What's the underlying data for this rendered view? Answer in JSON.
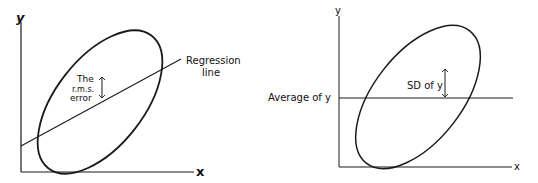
{
  "left_panel": {
    "y_axis_label": "y",
    "x_axis_label": "x",
    "line_label_1": "Regression",
    "line_label_2": "line",
    "arrow_label_1": "The",
    "arrow_label_2": "r.m.s.",
    "arrow_label_3": "error"
  },
  "right_panel": {
    "y_axis_label": "y",
    "x_axis_label": "x",
    "line_label": "Average of y",
    "arrow_label": "SD of y"
  },
  "colors": {
    "ink": "#1a1a1a",
    "background": "#ffffff"
  }
}
